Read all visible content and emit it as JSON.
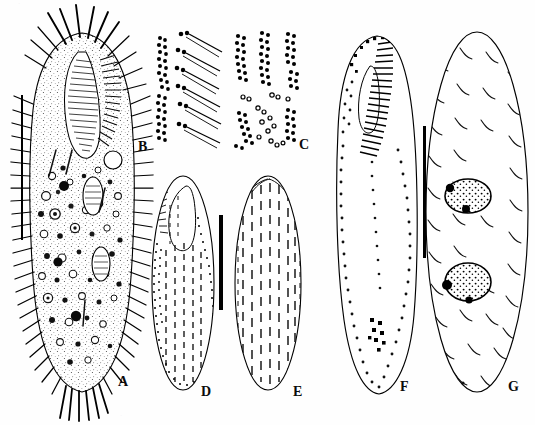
{
  "figure": {
    "kind": "scientific-plate",
    "background_color": "#ffffff",
    "ink_color": "#000000",
    "width": 535,
    "height": 425,
    "running_head": "·",
    "footer_text": "·"
  },
  "panels": [
    {
      "id": "A",
      "label": "A",
      "label_x": 118,
      "label_y": 382,
      "caption": "ventral view of a representative live specimen",
      "view": "live cell, ventral",
      "features": [
        "cilia",
        "frontal cirri",
        "marginal cirri",
        "buccal field",
        "cortical granules",
        "food vacuoles",
        "macronuclear nodules"
      ],
      "outline_color": "#000000",
      "cx": 82,
      "cy": 215,
      "rx": 52,
      "ry": 182
    },
    {
      "id": "B",
      "label": "B",
      "label_x": 142,
      "label_y": 148,
      "caption": "protargol-impregnated oral and frontoventral ciliature detail",
      "view": "silver impregnation detail",
      "features": [
        "kinety granule rows",
        "cirral bases",
        "cilia shafts"
      ],
      "outline_color": "#000000"
    },
    {
      "id": "C",
      "label": "C",
      "label_x": 303,
      "label_y": 146,
      "caption": "protargol-impregnated basal body clusters",
      "view": "silver impregnation detail",
      "features": [
        "basal body rows",
        "scattered basal granules"
      ],
      "outline_color": "#000000"
    },
    {
      "id": "D",
      "label": "D",
      "label_x": 205,
      "label_y": 392,
      "caption": "ventral infraciliature showing adoral zone and ventral kineties",
      "view": "ventral",
      "features": [
        "adoral zone of membranelles",
        "buccal cavity",
        "ventral kineties",
        "marginal rows"
      ],
      "outline_color": "#000000",
      "cx": 183,
      "cy": 283,
      "rx": 32,
      "ry": 108
    },
    {
      "id": "E",
      "label": "E",
      "label_x": 297,
      "label_y": 392,
      "caption": "dorsal infraciliature showing dorsal kineties",
      "view": "dorsal",
      "features": [
        "dorsal kineties",
        "dikinetids"
      ],
      "outline_color": "#000000",
      "cx": 268,
      "cy": 283,
      "rx": 34,
      "ry": 108
    },
    {
      "id": "F",
      "label": "F",
      "label_x": 404,
      "label_y": 388,
      "caption": "ventral infraciliature after silver nitrate impregnation",
      "view": "ventral",
      "features": [
        "adoral zone of membranelles",
        "paroral membrane",
        "ventral cirri row",
        "transverse cirri",
        "marginal cirri"
      ],
      "outline_color": "#000000",
      "cx": 377,
      "cy": 215,
      "rx": 40,
      "ry": 182
    },
    {
      "id": "G",
      "label": "G",
      "label_x": 512,
      "label_y": 388,
      "caption": "dorsal view showing nuclear apparatus and dorsal bristles",
      "view": "dorsal",
      "features": [
        "two macronuclear nodules",
        "micronuclei",
        "dorsal bristles"
      ],
      "outline_color": "#000000",
      "cx": 477,
      "cy": 212,
      "rx": 52,
      "ry": 183,
      "macronuclei": 2,
      "micronuclei": 3
    }
  ],
  "scale_bars": [
    {
      "id": "bar-a",
      "applies_to": "A",
      "x": 21,
      "y_top": 95,
      "y_bottom": 240,
      "thickness": 2
    },
    {
      "id": "bar-de",
      "applies_to": "D, E",
      "x": 221,
      "y_top": 215,
      "y_bottom": 310,
      "thickness": 4
    },
    {
      "id": "bar-fg",
      "applies_to": "F, G",
      "x": 424,
      "y_top": 126,
      "y_bottom": 258,
      "thickness": 3
    }
  ]
}
